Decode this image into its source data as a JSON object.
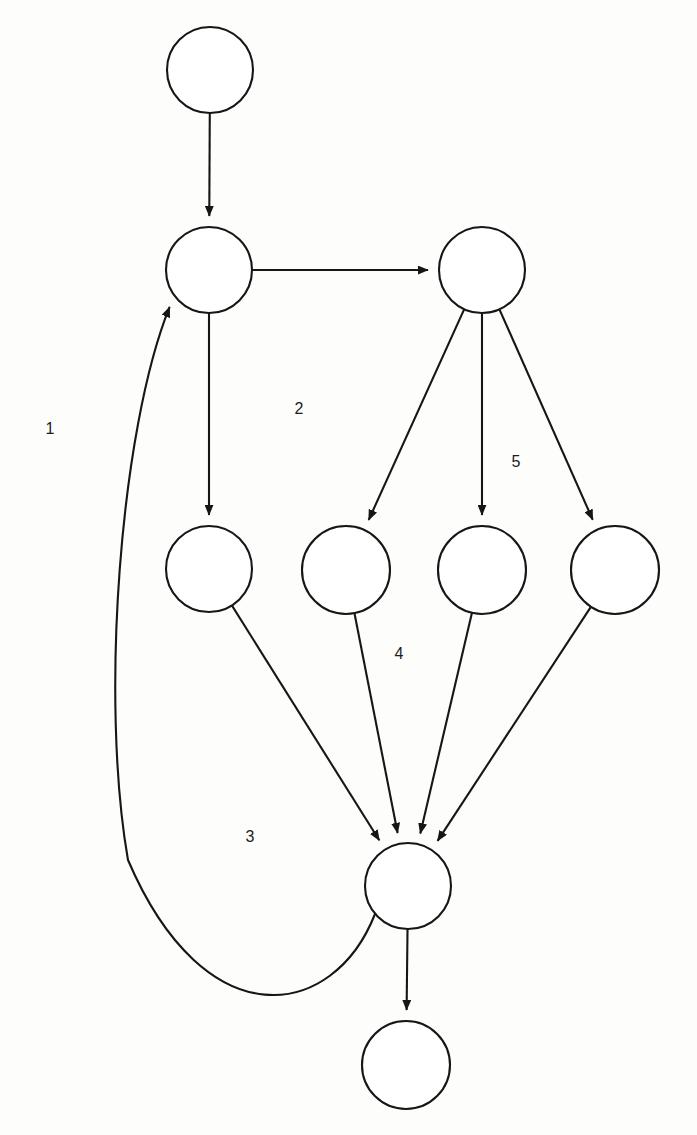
{
  "diagram": {
    "type": "directed-graph",
    "title": "",
    "background_color": "#fdfdfc",
    "stroke_color": "#161616",
    "node_fill": "#ffffff",
    "node_count": 9,
    "edge_count": 12,
    "label_count": 5,
    "nodes": [
      {
        "id": "n1",
        "label": "",
        "cx": 210,
        "cy": 70,
        "r": 43,
        "name": "node-top"
      },
      {
        "id": "n2",
        "label": "",
        "cx": 209,
        "cy": 270,
        "r": 43,
        "name": "node-second-left"
      },
      {
        "id": "n3",
        "label": "",
        "cx": 482,
        "cy": 270,
        "r": 43,
        "name": "node-second-right"
      },
      {
        "id": "n4",
        "label": "",
        "cx": 209,
        "cy": 569,
        "r": 43,
        "name": "node-middle-1"
      },
      {
        "id": "n5",
        "label": "",
        "cx": 346,
        "cy": 570,
        "r": 44,
        "name": "node-middle-2"
      },
      {
        "id": "n6",
        "label": "",
        "cx": 482,
        "cy": 570,
        "r": 44,
        "name": "node-middle-3"
      },
      {
        "id": "n7",
        "label": "",
        "cx": 615,
        "cy": 570,
        "r": 44,
        "name": "node-middle-4"
      },
      {
        "id": "n8",
        "label": "",
        "cx": 408,
        "cy": 886,
        "r": 43,
        "name": "node-convergence"
      },
      {
        "id": "n9",
        "label": "",
        "cx": 406,
        "cy": 1065,
        "r": 44,
        "name": "node-bottom"
      }
    ],
    "edges": [
      {
        "id": "e1",
        "from": "n1",
        "to": "n2",
        "shape": "straight",
        "name": "edge-top-to-second-left"
      },
      {
        "id": "e2",
        "from": "n2",
        "to": "n3",
        "shape": "straight",
        "name": "edge-second-left-to-second-right"
      },
      {
        "id": "e3",
        "from": "n2",
        "to": "n4",
        "shape": "straight",
        "name": "edge-second-left-to-middle-1"
      },
      {
        "id": "e4",
        "from": "n3",
        "to": "n5",
        "shape": "straight",
        "name": "edge-second-right-to-middle-2"
      },
      {
        "id": "e5",
        "from": "n3",
        "to": "n6",
        "shape": "straight",
        "name": "edge-second-right-to-middle-3"
      },
      {
        "id": "e6",
        "from": "n3",
        "to": "n7",
        "shape": "straight",
        "name": "edge-second-right-to-middle-4"
      },
      {
        "id": "e7",
        "from": "n4",
        "to": "n8",
        "shape": "straight",
        "name": "edge-middle-1-to-convergence"
      },
      {
        "id": "e8",
        "from": "n5",
        "to": "n8",
        "shape": "straight",
        "name": "edge-middle-2-to-convergence"
      },
      {
        "id": "e9",
        "from": "n6",
        "to": "n8",
        "shape": "straight",
        "name": "edge-middle-3-to-convergence"
      },
      {
        "id": "e10",
        "from": "n7",
        "to": "n8",
        "shape": "straight",
        "name": "edge-middle-4-to-convergence"
      },
      {
        "id": "e11",
        "from": "n8",
        "to": "n9",
        "shape": "straight",
        "name": "edge-convergence-to-bottom"
      },
      {
        "id": "e12",
        "from": "n8",
        "to": "n2",
        "shape": "curved",
        "name": "edge-feedback-convergence-to-second-left"
      }
    ],
    "labels": [
      {
        "text": "1",
        "x": 50,
        "y": 430,
        "name": "edge-label-1"
      },
      {
        "text": "2",
        "x": 299,
        "y": 410,
        "name": "edge-label-2"
      },
      {
        "text": "3",
        "x": 250,
        "y": 838,
        "name": "edge-label-3"
      },
      {
        "text": "4",
        "x": 399,
        "y": 655,
        "name": "edge-label-4"
      },
      {
        "text": "5",
        "x": 516,
        "y": 463,
        "name": "edge-label-5"
      }
    ]
  }
}
